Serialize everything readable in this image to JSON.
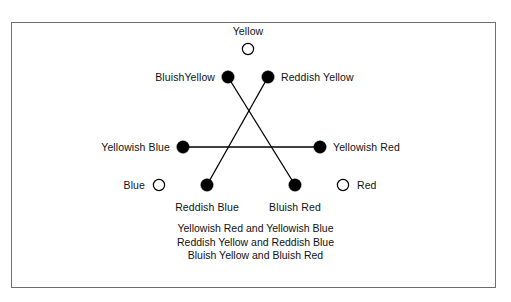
{
  "figure": {
    "frame": {
      "border_color": "#6e6e6e",
      "background": "#ffffff"
    },
    "ink_color": "#000000"
  },
  "nodes": [
    {
      "id": "yellow",
      "label": "Yellow",
      "type": "open",
      "x": 248,
      "y": 49,
      "label_x": 248,
      "label_y": 31,
      "label_align": "center"
    },
    {
      "id": "bluish-yellow",
      "label": "BluishYellow",
      "type": "filled",
      "x": 228,
      "y": 77,
      "label_x": 215,
      "label_y": 77,
      "label_align": "left"
    },
    {
      "id": "reddish-yellow",
      "label": "Reddish Yellow",
      "type": "filled",
      "x": 268,
      "y": 77,
      "label_x": 281,
      "label_y": 77,
      "label_align": "right"
    },
    {
      "id": "yellowish-blue",
      "label": "Yellowish Blue",
      "type": "filled",
      "x": 183,
      "y": 147,
      "label_x": 170,
      "label_y": 147,
      "label_align": "left"
    },
    {
      "id": "yellowish-red",
      "label": "Yellowish Red",
      "type": "filled",
      "x": 320,
      "y": 147,
      "label_x": 333,
      "label_y": 147,
      "label_align": "right"
    },
    {
      "id": "blue",
      "label": "Blue",
      "type": "open",
      "x": 159,
      "y": 185,
      "label_x": 145,
      "label_y": 185,
      "label_align": "left"
    },
    {
      "id": "reddish-blue",
      "label": "Reddish Blue",
      "type": "filled",
      "x": 207,
      "y": 185,
      "label_x": 207,
      "label_y": 207,
      "label_align": "center"
    },
    {
      "id": "bluish-red",
      "label": "Bluish Red",
      "type": "filled",
      "x": 295,
      "y": 185,
      "label_x": 295,
      "label_y": 207,
      "label_align": "center"
    },
    {
      "id": "red",
      "label": "Red",
      "type": "open",
      "x": 343,
      "y": 185,
      "label_x": 357,
      "label_y": 185,
      "label_align": "right"
    }
  ],
  "edges": [
    {
      "id": "edge-yellowish",
      "from": "yellowish-blue",
      "to": "yellowish-red",
      "x1": 183,
      "y1": 147,
      "x2": 320,
      "y2": 147
    },
    {
      "id": "edge-reddish",
      "from": "reddish-yellow",
      "to": "reddish-blue",
      "x1": 268,
      "y1": 77,
      "x2": 207,
      "y2": 185
    },
    {
      "id": "edge-bluish",
      "from": "bluish-yellow",
      "to": "bluish-red",
      "x1": 228,
      "y1": 77,
      "x2": 295,
      "y2": 185
    }
  ],
  "caption": {
    "lines": [
      "Yellowish Red and Yellowish Blue",
      "Reddish Yellow and Reddish Blue",
      "Bluish Yellow and Bluish Red"
    ]
  }
}
